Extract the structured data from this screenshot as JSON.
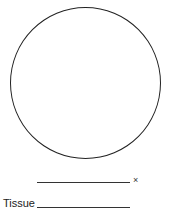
{
  "diagram": {
    "field_of_view": "circle",
    "magnification": {
      "value": "",
      "suffix": "×"
    },
    "tissue": {
      "label": "Tissue",
      "value": ""
    }
  }
}
